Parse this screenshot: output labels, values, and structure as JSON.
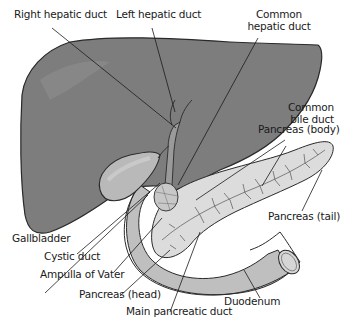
{
  "figure": {
    "colors": {
      "liver": "#7d7d7d",
      "liver_outline": "#2a2a2a",
      "gallbladder": "#b9b9b9",
      "pancreas": "#dcdcdc",
      "duodenum": "#bfbfbf",
      "leader_line": "#1a1a1a",
      "background": "#ffffff"
    }
  },
  "labels": {
    "right_hepatic_duct": "Right hepatic duct",
    "left_hepatic_duct": "Left hepatic duct",
    "common_hepatic_duct_line1": "Common",
    "common_hepatic_duct_line2": "hepatic duct",
    "common_bile_duct_line1": "Common",
    "common_bile_duct_line2": "bile duct",
    "pancreas_body": "Pancreas (body)",
    "pancreas_tail": "Pancreas (tail)",
    "gallbladder": "Gallbladder",
    "cystic_duct": "Cystic duct",
    "ampulla_of_vater": "Ampulla of Vater",
    "pancreas_head": "Pancreas (head)",
    "main_pancreatic_duct": "Main pancreatic duct",
    "duodenum": "Duodenum"
  }
}
